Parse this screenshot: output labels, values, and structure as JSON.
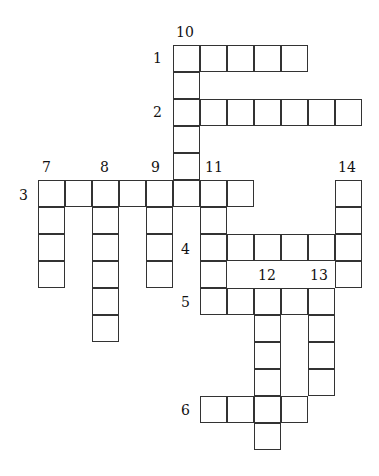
{
  "puzzle": {
    "type": "crossword",
    "cell_size": 27,
    "origin": [
      38,
      45
    ],
    "cells": [
      [
        0,
        5
      ],
      [
        0,
        6
      ],
      [
        0,
        7
      ],
      [
        0,
        8
      ],
      [
        0,
        9
      ],
      [
        1,
        5
      ],
      [
        2,
        5
      ],
      [
        2,
        6
      ],
      [
        2,
        7
      ],
      [
        2,
        8
      ],
      [
        2,
        9
      ],
      [
        2,
        10
      ],
      [
        2,
        11
      ],
      [
        3,
        5
      ],
      [
        4,
        5
      ],
      [
        5,
        0
      ],
      [
        5,
        1
      ],
      [
        5,
        2
      ],
      [
        5,
        3
      ],
      [
        5,
        4
      ],
      [
        5,
        5
      ],
      [
        5,
        6
      ],
      [
        5,
        7
      ],
      [
        5,
        11
      ],
      [
        6,
        0
      ],
      [
        6,
        2
      ],
      [
        6,
        4
      ],
      [
        6,
        6
      ],
      [
        6,
        11
      ],
      [
        7,
        0
      ],
      [
        7,
        2
      ],
      [
        7,
        4
      ],
      [
        7,
        6
      ],
      [
        7,
        7
      ],
      [
        7,
        8
      ],
      [
        7,
        9
      ],
      [
        7,
        10
      ],
      [
        7,
        11
      ],
      [
        8,
        0
      ],
      [
        8,
        2
      ],
      [
        8,
        4
      ],
      [
        8,
        6
      ],
      [
        8,
        11
      ],
      [
        9,
        2
      ],
      [
        9,
        6
      ],
      [
        9,
        7
      ],
      [
        9,
        8
      ],
      [
        9,
        9
      ],
      [
        9,
        10
      ],
      [
        10,
        2
      ],
      [
        10,
        8
      ],
      [
        10,
        10
      ],
      [
        11,
        8
      ],
      [
        11,
        10
      ],
      [
        12,
        8
      ],
      [
        12,
        10
      ],
      [
        13,
        6
      ],
      [
        13,
        7
      ],
      [
        13,
        8
      ],
      [
        13,
        9
      ],
      [
        14,
        8
      ]
    ],
    "labels": [
      {
        "text": "10",
        "x": 176,
        "y": 25
      },
      {
        "text": "1",
        "x": 153,
        "y": 51
      },
      {
        "text": "2",
        "x": 153,
        "y": 105
      },
      {
        "text": "7",
        "x": 42,
        "y": 160
      },
      {
        "text": "8",
        "x": 100,
        "y": 160
      },
      {
        "text": "9",
        "x": 151,
        "y": 160
      },
      {
        "text": "11",
        "x": 205,
        "y": 160
      },
      {
        "text": "14",
        "x": 338,
        "y": 160
      },
      {
        "text": "3",
        "x": 19,
        "y": 188
      },
      {
        "text": "4",
        "x": 181,
        "y": 242
      },
      {
        "text": "12",
        "x": 258,
        "y": 268
      },
      {
        "text": "13",
        "x": 310,
        "y": 268
      },
      {
        "text": "5",
        "x": 181,
        "y": 295
      },
      {
        "text": "6",
        "x": 181,
        "y": 403
      }
    ]
  }
}
